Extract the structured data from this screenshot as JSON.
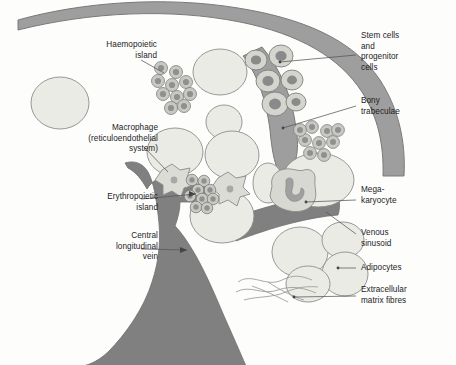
{
  "figure": {
    "background_color": "#fdfdfc"
  },
  "palette": {
    "trabecula_fill": "#9e9e9e",
    "trabecula_stroke": "#7a7a7a",
    "vein_fill": "#808080",
    "vein_stroke": "#6e6e6e",
    "pale_cell_fill": "#ebebe6",
    "pale_cell_stroke": "#8c8c8c",
    "small_cell_fill": "#c9c9c4",
    "small_cell_nucleus": "#909090",
    "stem_cell_fill": "#d5d5d0",
    "stem_cell_nucleus": "#8a8a8a",
    "macrophage_fill": "#dcdcd7",
    "macrophage_stroke": "#8a8a8a",
    "megakaryocyte_fill": "#d8d8d3",
    "megakaryocyte_nucleus": "#a0a0a0",
    "fibre_stroke": "#9a9a9a",
    "leader_line": "#555555",
    "text_color": "#1c1c1c"
  },
  "labels": {
    "haemopoietic_island": {
      "text": "Haemopoietic\nisland",
      "align": "right",
      "x": 65,
      "y": 40,
      "width": 92
    },
    "macrophage": {
      "text": "Macrophage\n(reticuloendothelial\nsystem)",
      "align": "right",
      "x": 48,
      "y": 123,
      "width": 110
    },
    "erythropoietic_island": {
      "text": "Erythropoietic\nisland",
      "align": "right",
      "x": 63,
      "y": 192,
      "width": 95
    },
    "central_longitudinal_vein": {
      "text": "Central\nlongitudinal\nvein",
      "align": "right",
      "x": 63,
      "y": 231,
      "width": 95
    },
    "stem_and_progenitor_cells": {
      "text": "Stem cells\nand\nprogenitor\ncells",
      "align": "left",
      "x": 361,
      "y": 31,
      "width": 95
    },
    "bony_trabeculae": {
      "text": "Bony\ntrabeculae",
      "align": "left",
      "x": 361,
      "y": 96,
      "width": 95
    },
    "megakaryocyte": {
      "text": "Mega-\nkaryocyte",
      "align": "left",
      "x": 361,
      "y": 185,
      "width": 95
    },
    "venous_sinusoid": {
      "text": "Venous\nsinusoid",
      "align": "left",
      "x": 361,
      "y": 228,
      "width": 95
    },
    "adipocytes": {
      "text": "Adipocytes",
      "align": "left",
      "x": 361,
      "y": 263,
      "width": 95
    },
    "extracellular_matrix_fibres": {
      "text": "Extracellular\nmatrix fibres",
      "align": "left",
      "x": 361,
      "y": 285,
      "width": 95
    }
  },
  "structures": {
    "bony_trabecula_top": "Curved cortical bone band sweeping from upper-left edge across the top to the right edge",
    "bony_trabecula_right": "Branch of bone descending from the top band down the right side",
    "central_longitudinal_vein": "Large central vertical vessel widening toward the bottom",
    "venous_sinusoid": "Horizontal sinusoid branching to the lower right of the central vein",
    "haemopoietic_island_cells": 10,
    "erythropoietic_island_cells": 9,
    "stem_progenitor_cells": 6,
    "second_cell_cluster": 9,
    "macrophages": 2,
    "megakaryocytes": 1,
    "adipocytes": 4,
    "pale_fat_cells": 8,
    "matrix_fibres": 5
  }
}
